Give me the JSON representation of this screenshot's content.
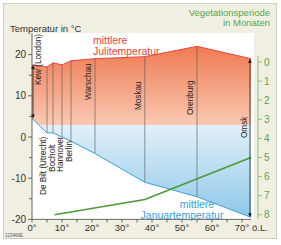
{
  "chart_data": {
    "type": "line",
    "title": "",
    "left_axis_label": "Temperatur in °C",
    "right_axis_label": [
      "Vegetationsperiode",
      "in Monaten"
    ],
    "xlabel": "ö.L.",
    "x_ticks": [
      "0°",
      "10°",
      "20°",
      "30°",
      "40°",
      "50°",
      "60°",
      "70°"
    ],
    "x_tick_values": [
      0,
      10,
      20,
      30,
      40,
      50,
      60,
      70
    ],
    "y_ticks": [
      "20",
      "10",
      "0",
      "-10",
      "-20"
    ],
    "y_tick_values": [
      20,
      10,
      0,
      -10,
      -20
    ],
    "ylim": [
      -20,
      23
    ],
    "right_ticks": [
      "0",
      "1",
      "2",
      "3",
      "4",
      "5",
      "6",
      "7",
      "8"
    ],
    "right_tick_values": [
      0,
      1,
      2,
      3,
      4,
      5,
      6,
      7,
      8
    ],
    "right_ylim": [
      0,
      8
    ],
    "right_axis_inverted": true,
    "grid": false,
    "stations": [
      {
        "name": "Kew (London)",
        "lon": 0
      },
      {
        "name": "De Bilt (Utrecht)",
        "lon": 5
      },
      {
        "name": "Bocholt",
        "lon": 7
      },
      {
        "name": "Hannover",
        "lon": 10
      },
      {
        "name": "Berlin",
        "lon": 13
      },
      {
        "name": "Warschau",
        "lon": 21
      },
      {
        "name": "Moskau",
        "lon": 37.6
      },
      {
        "name": "Orenburg",
        "lon": 55
      },
      {
        "name": "Omsk",
        "lon": 73
      }
    ],
    "series": [
      {
        "name": "mittlere Julitemperatur",
        "color": "#e8453c",
        "axis": "left",
        "x": [
          0,
          5,
          7,
          10,
          13,
          21,
          37.6,
          55,
          73
        ],
        "values": [
          17.5,
          17,
          18,
          17.5,
          18.5,
          19,
          19.5,
          22,
          19
        ]
      },
      {
        "name": "mittlere Januartemperatur",
        "color": "#3aa0d8",
        "axis": "left",
        "x": [
          0,
          5,
          7,
          10,
          13,
          21,
          37.6,
          55,
          73
        ],
        "values": [
          4.5,
          1,
          1,
          0,
          -1,
          -4,
          -11,
          -14.5,
          -19.5
        ]
      },
      {
        "name": "Vegetationsperiode",
        "color": "#4e9a3a",
        "axis": "right",
        "x": [
          7.5,
          37.6,
          73
        ],
        "values": [
          8,
          7.2,
          5
        ]
      }
    ],
    "annotations": [
      {
        "text": "mittlere Julitemperatur",
        "color": "#e8453c"
      },
      {
        "text": "mittlere Januartemperatur",
        "color": "#3aa0d8"
      }
    ],
    "legend_position": "none"
  },
  "labels": {
    "left_axis": "Temperatur in °C",
    "right_axis_line1": "Vegetationsperiode",
    "right_axis_line2": "in Monaten",
    "july_line1": "mittlere",
    "july_line2": "Julitemperatur",
    "jan_line1": "mittlere",
    "jan_line2": "Januartemperatur",
    "x_unit": "ö.L.",
    "image_code": "123466E"
  },
  "colors": {
    "frame_bg": "#f1efe2",
    "july": "#e8453c",
    "january": "#3aa0d8",
    "vegetation": "#4e9a3a",
    "axis_text": "#333333",
    "right_axis_text": "#5aa54a"
  }
}
